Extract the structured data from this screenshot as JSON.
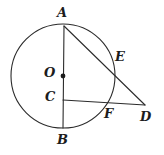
{
  "figure": {
    "stroke_color": "#2b2b2b",
    "background_color": "#ffffff",
    "stroke_width": 1.1
  },
  "circle": {
    "name": "main-circle",
    "center_x": 63,
    "center_y": 76,
    "radius": 52
  },
  "points": {
    "A": {
      "label": "A",
      "x": 64,
      "y": 26,
      "label_x": 57,
      "label_y": 6
    },
    "B": {
      "label": "B",
      "x": 63,
      "y": 128,
      "label_x": 57,
      "label_y": 133
    },
    "C": {
      "label": "C",
      "x": 63,
      "y": 100,
      "label_x": 45,
      "label_y": 90
    },
    "D": {
      "label": "D",
      "x": 145,
      "y": 105,
      "label_x": 140,
      "label_y": 110
    },
    "E": {
      "label": "E",
      "x": 108,
      "y": 66,
      "label_x": 115,
      "label_y": 50
    },
    "F": {
      "label": "F",
      "x": 106,
      "y": 102,
      "label_x": 104,
      "label_y": 107
    },
    "O": {
      "label": "O",
      "x": 63,
      "y": 76,
      "label_x": 44,
      "label_y": 66
    }
  },
  "segments": [
    {
      "name": "segment-AB",
      "from": "A",
      "to": "B"
    },
    {
      "name": "segment-AD",
      "from": "A",
      "to": "D"
    },
    {
      "name": "segment-CD",
      "from": "C",
      "to": "D"
    }
  ],
  "markers": [
    {
      "name": "center-dot-O",
      "x": 63,
      "y": 76,
      "r": 2.4
    }
  ],
  "labels_order": [
    "A",
    "E",
    "O",
    "C",
    "F",
    "D",
    "B"
  ]
}
